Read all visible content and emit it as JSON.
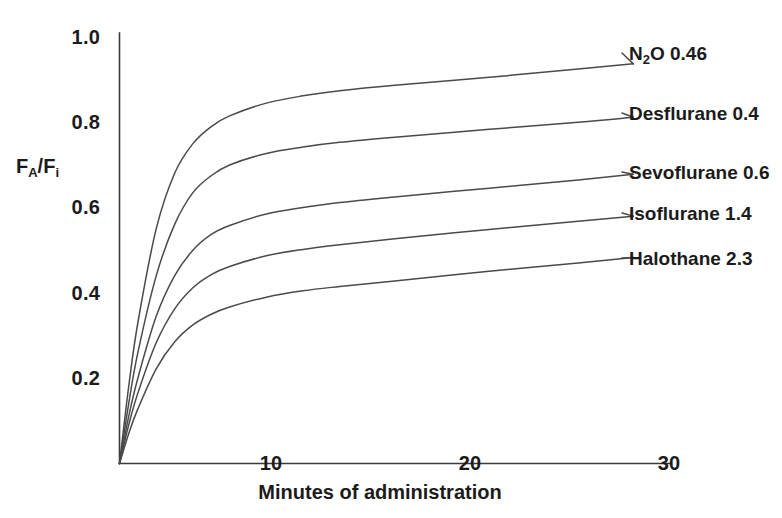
{
  "chart_data": {
    "type": "line",
    "title": "",
    "xlabel": "Minutes of administration",
    "ylabel": "FA/Fi",
    "ylabel_parts": {
      "main1": "F",
      "sub1": "A",
      "slash": "/F",
      "sub2": "i"
    },
    "xlim": [
      0,
      30
    ],
    "ylim": [
      0,
      1.0
    ],
    "grid": false,
    "legend_position": "right-inline-labels",
    "xticks": [
      10,
      20,
      30
    ],
    "xtick_labels": [
      "10",
      "20",
      "30"
    ],
    "yticks": [
      0.2,
      0.4,
      0.6,
      0.8,
      1.0
    ],
    "ytick_labels": [
      "0.2",
      "0.4",
      "0.6",
      "0.8",
      "1.0"
    ],
    "x": [
      0,
      0.5,
      1,
      2,
      3,
      4,
      5,
      6,
      8,
      10,
      12,
      15,
      20,
      25,
      28
    ],
    "series": [
      {
        "name": "N2O 0.46",
        "label_main": "N",
        "label_sub": "2",
        "label_rest": "O 0.46",
        "mac": 0.46,
        "values": [
          0.0,
          0.18,
          0.33,
          0.55,
          0.68,
          0.75,
          0.79,
          0.815,
          0.845,
          0.862,
          0.874,
          0.887,
          0.905,
          0.925,
          0.937
        ]
      },
      {
        "name": "Desflurane 0.4",
        "label_main": "Desflurane 0.4",
        "mac": 0.4,
        "values": [
          0.0,
          0.14,
          0.26,
          0.44,
          0.56,
          0.635,
          0.675,
          0.7,
          0.727,
          0.742,
          0.753,
          0.765,
          0.783,
          0.8,
          0.812
        ]
      },
      {
        "name": "Sevoflurane 0.6",
        "label_main": "Sevoflurane 0.6",
        "mac": 0.6,
        "values": [
          0.0,
          0.11,
          0.2,
          0.345,
          0.44,
          0.5,
          0.537,
          0.558,
          0.585,
          0.6,
          0.612,
          0.625,
          0.645,
          0.665,
          0.678
        ]
      },
      {
        "name": "Isoflurane 1.4",
        "label_main": "Isoflurane 1.4",
        "mac": 1.4,
        "values": [
          0.0,
          0.09,
          0.165,
          0.283,
          0.362,
          0.412,
          0.443,
          0.462,
          0.487,
          0.502,
          0.513,
          0.527,
          0.548,
          0.568,
          0.58
        ]
      },
      {
        "name": "Halothane 2.3",
        "label_main": "Halothane 2.3",
        "mac": 2.3,
        "values": [
          0.0,
          0.07,
          0.128,
          0.222,
          0.285,
          0.325,
          0.35,
          0.367,
          0.39,
          0.405,
          0.415,
          0.428,
          0.45,
          0.47,
          0.483
        ]
      }
    ],
    "colors": {
      "line": "#4a4a4a",
      "axis": "#3a3a3a",
      "text": "#1b1b1b",
      "background": "#ffffff"
    }
  }
}
